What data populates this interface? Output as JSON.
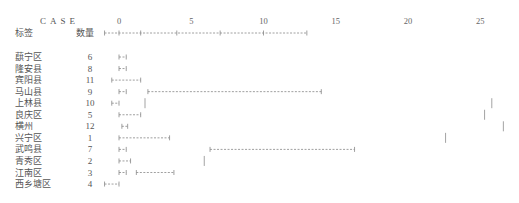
{
  "chart_data": {
    "type": "table",
    "title": "CASE",
    "column_headers": {
      "label": "标签",
      "count": "数量"
    },
    "x_ticks": [
      0,
      5,
      10,
      15,
      20,
      25
    ],
    "x_range": [
      0,
      26
    ],
    "axis_markers": [
      -1,
      0,
      1.5,
      4,
      7,
      10,
      13
    ],
    "rows": [
      {
        "label": "蕻宁区",
        "count": "6",
        "segments": [
          [
            0,
            0.5
          ]
        ],
        "bars": []
      },
      {
        "label": "隆安县",
        "count": "8",
        "segments": [
          [
            0,
            0.5
          ]
        ],
        "bars": []
      },
      {
        "label": "宾阳县",
        "count": "11",
        "segments": [
          [
            -0.5,
            1.5
          ]
        ],
        "bars": []
      },
      {
        "label": "马山县",
        "count": "9",
        "segments": [
          [
            0,
            0.5
          ],
          [
            2,
            14
          ]
        ],
        "bars": []
      },
      {
        "label": "上林县",
        "count": "10",
        "segments": [
          [
            -0.5,
            0
          ]
        ],
        "bars": [
          1.8,
          25.8
        ]
      },
      {
        "label": "良庆区",
        "count": "5",
        "segments": [
          [
            0,
            1.5
          ]
        ],
        "bars": [
          25.3
        ]
      },
      {
        "label": "横州",
        "count": "12",
        "segments": [
          [
            0.2,
            0.6
          ]
        ],
        "bars": [
          26.6
        ]
      },
      {
        "label": "兴宁区",
        "count": "1",
        "segments": [
          [
            0,
            3.5
          ]
        ],
        "bars": [
          22.6
        ]
      },
      {
        "label": "武鸣县",
        "count": "7",
        "segments": [
          [
            0,
            0.5
          ],
          [
            6.3,
            16.3
          ]
        ],
        "bars": []
      },
      {
        "label": "青秀区",
        "count": "2",
        "segments": [
          [
            0,
            0.8
          ]
        ],
        "bars": [
          5.9
        ]
      },
      {
        "label": "江南区",
        "count": "3",
        "segments": [
          [
            0,
            0.5
          ],
          [
            1.2,
            3.8
          ]
        ],
        "bars": []
      },
      {
        "label": "西乡塘区",
        "count": "4",
        "segments": [
          [
            -1,
            0
          ]
        ],
        "bars": []
      }
    ]
  },
  "colors": {
    "text": "#555555",
    "line": "#888888"
  }
}
